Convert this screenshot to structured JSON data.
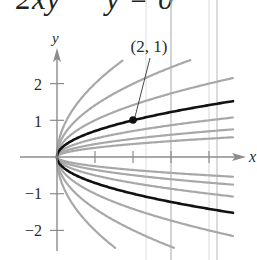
{
  "title": "2xy′ − y = 0",
  "axes": {
    "x_label": "x",
    "y_label": "y",
    "y_tick_labels": [
      "2",
      "1",
      "−1",
      "−2"
    ],
    "x_ticks": [
      1,
      2,
      3,
      4
    ],
    "y_ticks": [
      2,
      1,
      -1,
      -2
    ]
  },
  "annotation": {
    "point_label": "(2, 1)",
    "point": [
      2,
      1
    ]
  },
  "colors": {
    "family_curve": "#a8a8a8",
    "particular_curve": "#111111",
    "axis": "#8c8c8c",
    "page_rule_light": "#e6e6e6",
    "page_rule_dark": "#b5b5b5"
  },
  "chart_data": {
    "type": "line",
    "title": "2xy′ − y = 0",
    "xlabel": "x",
    "ylabel": "y",
    "xlim": [
      0,
      4.9
    ],
    "ylim": [
      -2.6,
      2.8
    ],
    "x_ticks": [
      1,
      2,
      3,
      4
    ],
    "y_ticks": [
      -2,
      -1,
      1,
      2
    ],
    "grid": false,
    "series": [
      {
        "name": "C = 2",
        "C": 2.0,
        "color": "gray"
      },
      {
        "name": "C = 1.41",
        "C": 1.41,
        "color": "gray"
      },
      {
        "name": "C = 1",
        "C": 1.0,
        "color": "gray"
      },
      {
        "name": "particular solution y = √(x/2)",
        "C": 0.707,
        "color": "black"
      },
      {
        "name": "C = 0.5",
        "C": 0.5,
        "color": "gray"
      },
      {
        "name": "C = 0.35",
        "C": 0.35,
        "color": "gray"
      },
      {
        "name": "C = 0.25",
        "C": 0.25,
        "color": "gray"
      },
      {
        "name": "C = -0.25",
        "C": -0.25,
        "color": "gray"
      },
      {
        "name": "C = -0.35",
        "C": -0.35,
        "color": "gray"
      },
      {
        "name": "C = -0.5",
        "C": -0.5,
        "color": "gray"
      },
      {
        "name": "particular solution (lower branch) y = -√(x/2)",
        "C": -0.707,
        "color": "black"
      },
      {
        "name": "C = -1",
        "C": -1.0,
        "color": "gray"
      },
      {
        "name": "C = -1.41",
        "C": -1.41,
        "color": "gray"
      },
      {
        "name": "C = -2",
        "C": -2.0,
        "color": "gray"
      }
    ],
    "annotations": [
      {
        "text": "(2, 1)",
        "x": 2,
        "y": 1,
        "marker": "filled-circle"
      }
    ]
  }
}
